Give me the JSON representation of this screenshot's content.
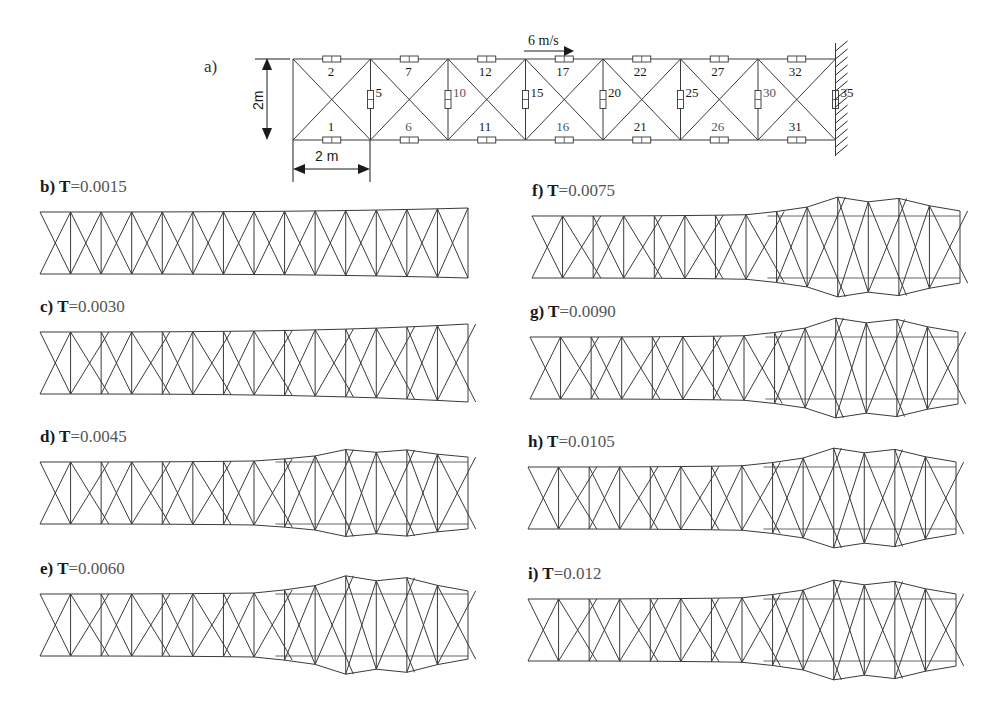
{
  "figure": {
    "part_a": {
      "label": "a)",
      "velocity_label": "6  m/s",
      "height_dim": "2m",
      "width_dim": "2 m",
      "top_members": [
        "2",
        "7",
        "12",
        "17",
        "22",
        "27",
        "32"
      ],
      "bottom_members": [
        "1",
        "6",
        "11",
        "16",
        "21",
        "26",
        "31"
      ],
      "vertical_members": [
        "5",
        "10",
        "15",
        "20",
        "25",
        "30",
        "35"
      ],
      "bays": 7,
      "origin_x": 293,
      "bay_width": 77.5,
      "top_y": 59,
      "bottom_y": 140,
      "support": "fixed-wall"
    },
    "snapshots": [
      {
        "id": "b",
        "prefix": "b)",
        "t_label": "T=",
        "t_value": "0.0015",
        "x": 40,
        "y": 212,
        "w": 428,
        "h": 62,
        "bulge": 0,
        "flare": 4
      },
      {
        "id": "c",
        "prefix": "c)",
        "t_label": "T=",
        "t_value": "0.0030",
        "x": 40,
        "y": 332,
        "w": 428,
        "h": 62,
        "bulge": 0,
        "flare": 8
      },
      {
        "id": "d",
        "prefix": "d)",
        "t_label": "T=",
        "t_value": "0.0045",
        "x": 40,
        "y": 462,
        "w": 428,
        "h": 62,
        "bulge": 10,
        "flare": 8
      },
      {
        "id": "e",
        "prefix": "e)",
        "t_label": "T=",
        "t_value": "0.0060",
        "x": 40,
        "y": 594,
        "w": 428,
        "h": 62,
        "bulge": 16,
        "flare": 8
      },
      {
        "id": "f",
        "prefix": "f)",
        "t_label": "T=",
        "t_value": "0.0075",
        "x": 532,
        "y": 216,
        "w": 428,
        "h": 62,
        "bulge": 16,
        "flare": 10
      },
      {
        "id": "g",
        "prefix": "g)",
        "t_label": "T=",
        "t_value": "0.0090",
        "x": 530,
        "y": 337,
        "w": 428,
        "h": 62,
        "bulge": 16,
        "flare": 10
      },
      {
        "id": "h",
        "prefix": "h)",
        "t_label": "T=",
        "t_value": "0.0105",
        "x": 528,
        "y": 467,
        "w": 428,
        "h": 62,
        "bulge": 16,
        "flare": 10
      },
      {
        "id": "i",
        "prefix": "i)",
        "t_label": "T=",
        "t_value": "0.012",
        "x": 528,
        "y": 599,
        "w": 428,
        "h": 62,
        "bulge": 16,
        "flare": 10
      }
    ]
  },
  "colors": {
    "line": "#3a3a3a",
    "text": "#1a1a1a",
    "text_light": "#555555",
    "background": "#ffffff"
  }
}
